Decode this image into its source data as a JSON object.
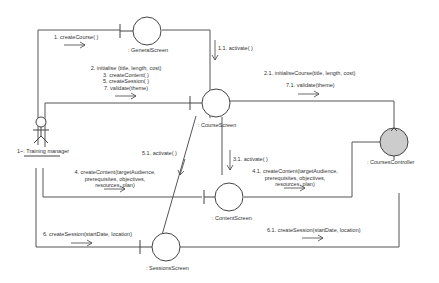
{
  "diagram": {
    "type": "UML communication diagram",
    "actor": {
      "name": "1~: Training manager"
    },
    "objects": {
      "general_screen": ": GeneralScreen",
      "course_screen": ": CourseScreen",
      "content_screen": ": ContentScreen",
      "sessions_screen": ": SessionsScreen",
      "courses_controller": ": CoursesController"
    },
    "messages": {
      "m1": "1. createCourse( )",
      "m1_1": "1.1. activate( )",
      "m2_lines": [
        "2. initialise (title, length, cost)",
        "3. createContent( )",
        "5. createSession( )",
        "7. validate(theme)"
      ],
      "m2_1": "2.1. initialiseCourse(title, length, cost)",
      "m7_1": "7.1. validate(theme)",
      "m3_1": "3.1. activate( )",
      "m5_1": "5.1. activate( )",
      "m4_lines": [
        "4. createContent(targetAudience,",
        "prerequisites, objectives,",
        "resources, plan)"
      ],
      "m4_1_lines": [
        "4.1. createContent(targetAudience,",
        "prerequisites, objectives,",
        "resources, plan)"
      ],
      "m6": "6. createSession(startDate, location)",
      "m6_1": "6.1. createSession(startDate, location)"
    },
    "colors": {
      "line": "#555555",
      "controller_fill": "#cccccc"
    }
  }
}
